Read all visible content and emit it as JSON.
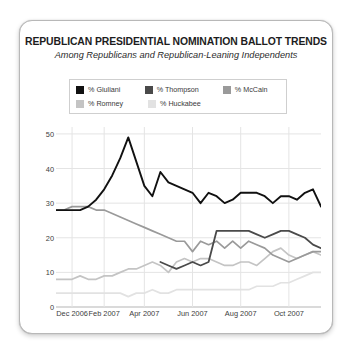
{
  "card": {
    "title": "REPUBLICAN PRESIDENTIAL NOMINATION BALLOT TRENDS",
    "subtitle": "Among Republicans and Republican-Leaning Independents"
  },
  "legend": {
    "rows": [
      [
        {
          "label": "% Giuliani",
          "color": "#111111"
        },
        {
          "label": "% Thompson",
          "color": "#4a4a4a"
        },
        {
          "label": "% McCain",
          "color": "#9a9a9a"
        }
      ],
      [
        {
          "label": "% Romney",
          "color": "#c4c4c4"
        },
        {
          "label": "% Huckabee",
          "color": "#e2e2e2"
        }
      ]
    ]
  },
  "chart_data": {
    "type": "line",
    "title": "REPUBLICAN PRESIDENTIAL NOMINATION BALLOT TRENDS",
    "subtitle": "Among Republicans and Republican-Leaning Independents",
    "xlabel": "",
    "ylabel": "",
    "ylim": [
      0,
      52
    ],
    "yticks": [
      0,
      10,
      20,
      30,
      40,
      50
    ],
    "grid": true,
    "legend_position": "top",
    "xtick_labels": [
      "Dec 2006",
      "Feb 2007",
      "Apr 2007",
      "Jun 2007",
      "Aug 2007",
      "Oct 2007"
    ],
    "xtick_positions": [
      2,
      6,
      11,
      17,
      23,
      29
    ],
    "x_count": 34,
    "series": [
      {
        "name": "% Giuliani",
        "color": "#111111",
        "width": 1.9,
        "values": [
          28,
          28,
          28,
          28,
          29,
          31,
          34,
          38,
          43,
          49,
          42,
          35,
          32,
          39,
          36,
          35,
          34,
          33,
          30,
          33,
          32,
          30,
          31,
          33,
          33,
          33,
          32,
          30,
          32,
          32,
          31,
          33,
          34,
          29
        ]
      },
      {
        "name": "% Thompson",
        "color": "#4a4a4a",
        "width": 1.8,
        "start_index": 13,
        "values": [
          13,
          12,
          11,
          12,
          13,
          12,
          13,
          22,
          22,
          22,
          22,
          22,
          21,
          20,
          21,
          22,
          22,
          21,
          20,
          18,
          17,
          16
        ]
      },
      {
        "name": "% McCain",
        "color": "#9a9a9a",
        "width": 1.7,
        "values": [
          28,
          28,
          29,
          29,
          29,
          28,
          28,
          27,
          26,
          25,
          24,
          23,
          22,
          21,
          20,
          19,
          19,
          16,
          19,
          18,
          19,
          17,
          19,
          17,
          19,
          18,
          17,
          15,
          14,
          13,
          14,
          15,
          16,
          16
        ]
      },
      {
        "name": "% Romney",
        "color": "#c4c4c4",
        "width": 1.7,
        "values": [
          8,
          8,
          8,
          9,
          8,
          8,
          9,
          9,
          10,
          11,
          11,
          12,
          13,
          12,
          10,
          13,
          14,
          13,
          14,
          14,
          13,
          12,
          12,
          13,
          13,
          12,
          14,
          16,
          17,
          15,
          14,
          15,
          16,
          15
        ]
      },
      {
        "name": "% Huckabee",
        "color": "#e2e2e2",
        "width": 1.7,
        "values": [
          4,
          4,
          4,
          4,
          4,
          4,
          4,
          4,
          4,
          3,
          4,
          4,
          5,
          4,
          4,
          5,
          5,
          5,
          5,
          5,
          5,
          5,
          5,
          5,
          5,
          6,
          6,
          6,
          7,
          7,
          8,
          9,
          10,
          10
        ]
      }
    ]
  }
}
